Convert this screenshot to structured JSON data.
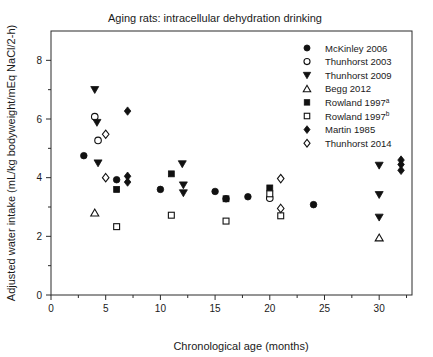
{
  "chart_data": {
    "type": "scatter",
    "title": "Aging rats: intracellular dehydration drinking",
    "xlabel": "Chronological age (months)",
    "ylabel": "Adjusted water intake (mL/kg bodyweight/mEq NaCl/2-h)",
    "xlim": [
      0,
      33
    ],
    "ylim": [
      0,
      9
    ],
    "xticks": [
      0,
      5,
      10,
      15,
      20,
      25,
      30
    ],
    "xticklabels": [
      "0",
      "5",
      "10",
      "15",
      "20",
      "25",
      "30"
    ],
    "yticks": [
      0,
      2,
      4,
      6,
      8
    ],
    "yticklabels": [
      "0",
      "2",
      "4",
      "6",
      "8"
    ],
    "x_minor_ticks": [
      2.5,
      7.5,
      12.5,
      17.5,
      22.5,
      27.5,
      32.5
    ],
    "y_minor_ticks": [
      1,
      3,
      5,
      7
    ],
    "grid": false,
    "legend_position": "top-right",
    "series": [
      {
        "name": "McKinley 2006",
        "marker": "circle",
        "filled": true,
        "points": [
          {
            "x": 3,
            "y": 4.75
          },
          {
            "x": 6,
            "y": 3.93
          },
          {
            "x": 10,
            "y": 3.6
          },
          {
            "x": 15,
            "y": 3.53
          },
          {
            "x": 16,
            "y": 3.28
          },
          {
            "x": 18,
            "y": 3.35
          },
          {
            "x": 24,
            "y": 3.08
          }
        ]
      },
      {
        "name": "Thunhorst 2003",
        "marker": "circle",
        "filled": false,
        "points": [
          {
            "x": 4,
            "y": 6.08
          },
          {
            "x": 4.3,
            "y": 5.27
          },
          {
            "x": 20,
            "y": 3.3
          }
        ]
      },
      {
        "name": "Thunhorst 2009",
        "marker": "triangle-down",
        "filled": true,
        "points": [
          {
            "x": 4,
            "y": 7.0
          },
          {
            "x": 4.2,
            "y": 5.88
          },
          {
            "x": 4.3,
            "y": 4.5
          },
          {
            "x": 12,
            "y": 4.47
          },
          {
            "x": 12.1,
            "y": 3.75
          },
          {
            "x": 12.1,
            "y": 3.48
          },
          {
            "x": 30,
            "y": 4.42
          },
          {
            "x": 30,
            "y": 3.42
          },
          {
            "x": 30,
            "y": 2.65
          }
        ]
      },
      {
        "name": "Begg 2012",
        "marker": "triangle-up",
        "filled": false,
        "points": [
          {
            "x": 4,
            "y": 2.8
          },
          {
            "x": 30,
            "y": 1.95
          }
        ]
      },
      {
        "name": "Rowland 1997a",
        "marker": "square",
        "filled": true,
        "points": [
          {
            "x": 6,
            "y": 3.6
          },
          {
            "x": 11,
            "y": 4.13
          },
          {
            "x": 16,
            "y": 3.28
          },
          {
            "x": 20,
            "y": 3.65
          }
        ]
      },
      {
        "name": "Rowland 1997b",
        "marker": "square",
        "filled": false,
        "points": [
          {
            "x": 6,
            "y": 2.33
          },
          {
            "x": 11,
            "y": 2.72
          },
          {
            "x": 16,
            "y": 2.52
          },
          {
            "x": 20,
            "y": 3.45
          },
          {
            "x": 21,
            "y": 2.7
          }
        ]
      },
      {
        "name": "Martin 1985",
        "marker": "diamond",
        "filled": true,
        "points": [
          {
            "x": 7,
            "y": 6.27
          },
          {
            "x": 7,
            "y": 4.05
          },
          {
            "x": 7,
            "y": 3.85
          },
          {
            "x": 32,
            "y": 4.6
          },
          {
            "x": 32,
            "y": 4.45
          },
          {
            "x": 32,
            "y": 4.25
          }
        ]
      },
      {
        "name": "Thunhorst 2014",
        "marker": "diamond",
        "filled": false,
        "points": [
          {
            "x": 5,
            "y": 5.48
          },
          {
            "x": 5,
            "y": 4.0
          },
          {
            "x": 21,
            "y": 3.97
          },
          {
            "x": 21,
            "y": 2.95
          }
        ]
      }
    ]
  },
  "legend": {
    "entries": [
      {
        "label": "McKinley 2006",
        "sup": "",
        "marker": "circle",
        "filled": true
      },
      {
        "label": "Thunhorst 2003",
        "sup": "",
        "marker": "circle",
        "filled": false
      },
      {
        "label": "Thunhorst 2009",
        "sup": "",
        "marker": "triangle-down",
        "filled": true
      },
      {
        "label": "Begg 2012",
        "sup": "",
        "marker": "triangle-up",
        "filled": false
      },
      {
        "label": "Rowland 1997",
        "sup": "a",
        "marker": "square",
        "filled": true
      },
      {
        "label": "Rowland 1997",
        "sup": "b",
        "marker": "square",
        "filled": false
      },
      {
        "label": "Martin 1985",
        "sup": "",
        "marker": "diamond",
        "filled": true
      },
      {
        "label": "Thunhorst 2014",
        "sup": "",
        "marker": "diamond",
        "filled": false
      }
    ]
  }
}
